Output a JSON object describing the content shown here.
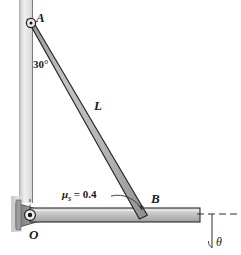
{
  "figure": {
    "labels": {
      "point_a": "A",
      "point_b": "B",
      "point_o": "O",
      "bar_length": "L",
      "angle_at_a": "30°",
      "friction_prefix": "μ",
      "friction_subscript": "s",
      "friction_value": "= 0.4",
      "friction_full": "μs = 0.4",
      "angle_theta": "θ"
    },
    "colors": {
      "wall_light": "#e9e9e9",
      "wall_mid": "#cfcfcf",
      "wall_edge": "#9a9a9a",
      "bar_light": "#d8d8d8",
      "bar_mid": "#bdbdbd",
      "bar_dark": "#9d9d9d",
      "outline": "#2b2b2b",
      "text": "#1a1a1a",
      "background": "#ffffff",
      "bracket_dark": "#8f8f8f"
    },
    "geometry": {
      "wall": {
        "x": 19,
        "y": 0,
        "width": 14,
        "height": 203
      },
      "pin_a": {
        "cx": 31,
        "cy": 23,
        "r": 4
      },
      "pin_o": {
        "cx": 30,
        "cy": 215,
        "r": 5
      },
      "inclined_bar": {
        "from": [
          31,
          23
        ],
        "to": [
          143,
          213
        ],
        "thickness": 8
      },
      "horizontal_bar": {
        "x": 30,
        "y": 208,
        "width": 170,
        "height": 14
      },
      "dashed_line": {
        "x1": 196,
        "y1": 214,
        "x2": 238,
        "y2": 214
      },
      "theta_line": {
        "x1": 212,
        "y1": 214,
        "x2": 212,
        "y2": 247
      }
    }
  }
}
